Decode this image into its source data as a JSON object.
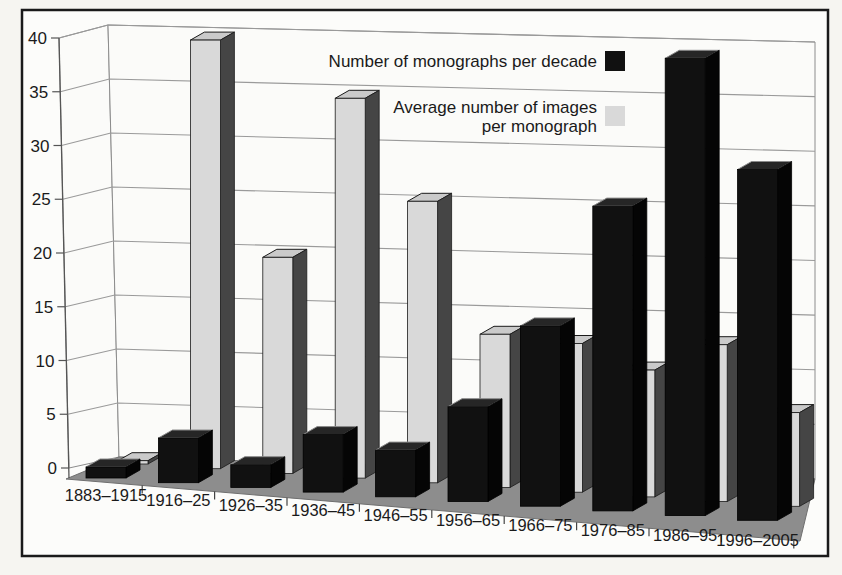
{
  "figure": {
    "background_color": "#f6f5f1",
    "frame_border_color": "#1a1a1a",
    "frame_fill_color": "#fcfcfa"
  },
  "legend": {
    "series1_label": "Number of monographs per decade",
    "series2_label_line1": "Average number of images",
    "series2_label_line2": "per monograph",
    "series1_color": "#111111",
    "series2_color": "#d9d9d9"
  },
  "chart_data": {
    "type": "bar",
    "projection": "3d",
    "title": "",
    "xlabel": "",
    "ylabel": "",
    "categories": [
      "1883–1915",
      "1916–25",
      "1926–35",
      "1936–45",
      "1946–55",
      "1956–65",
      "1966–75",
      "1976–85",
      "1986–95",
      "1996–2005"
    ],
    "series": [
      {
        "name": "Number of monographs per decade",
        "color": "#111111",
        "values": [
          1,
          4,
          2,
          5,
          4,
          8,
          15,
          25,
          37,
          28
        ]
      },
      {
        "name": "Average number of images per monograph",
        "color": "#d9d9d9",
        "values": [
          0.3,
          39,
          19.5,
          34,
          25,
          13.5,
          13,
          11,
          13.5,
          8
        ]
      }
    ],
    "ylim": [
      0,
      40
    ],
    "ytick_interval": 5,
    "yticks": [
      0,
      5,
      10,
      15,
      20,
      25,
      30,
      35,
      40
    ],
    "grid": true,
    "legend_position": "top-right",
    "colors": {
      "floor": "#8d8d8d",
      "wall": "#fbfbf9",
      "gridline": "#9a9a9a",
      "axis": "#555555",
      "text": "#1a1a1a"
    }
  }
}
